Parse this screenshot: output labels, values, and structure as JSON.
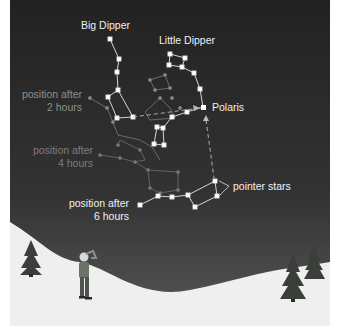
{
  "figure": {
    "sky_color_top": "#222222",
    "sky_color_bottom": "#555555",
    "snow_color": "#f0f0f0",
    "star_color": "#ffffff",
    "faded_star_color": "#8a8a8a",
    "dim_star_color": "#6e6e6e"
  },
  "labels": {
    "big_dipper": "Big Dipper",
    "little_dipper": "Little Dipper",
    "polaris": "Polaris",
    "pointer_stars": "pointer stars",
    "pos2_line1": "position after",
    "pos2_line2": "2 hours",
    "pos4_line1": "position after",
    "pos4_line2": "4 hours",
    "pos6_line1": "position after",
    "pos6_line2": "6 hours"
  },
  "icons": {
    "person": "stargazer-person",
    "trees": [
      "pine-tree-left",
      "pine-tree-right-front",
      "pine-tree-right-back"
    ]
  }
}
